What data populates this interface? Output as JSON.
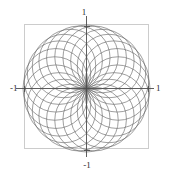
{
  "figure": {
    "title": "",
    "frame": {
      "x0": 24,
      "y0": 24,
      "x1": 149,
      "y1": 149,
      "color": "#cccccc",
      "visible": true
    },
    "axes": {
      "origin_x": 86.5,
      "origin_y": 88.5,
      "color": "#4d4d4d",
      "x_label_min": "-1",
      "x_label_max": "1",
      "y_label_min": "-1",
      "y_label_max": "1",
      "tick_length": 3
    },
    "curve_color": "#6b6b6b",
    "background": "#ffffff"
  },
  "labels": {
    "top": "1",
    "bottom": "-1",
    "left": "-1",
    "right": "1"
  },
  "chart_data": {
    "type": "line",
    "title": "",
    "xlabel": "",
    "ylabel": "",
    "xlim": [
      -1,
      1
    ],
    "ylim": [
      -1,
      1
    ],
    "xticks": [
      -1,
      1
    ],
    "yticks": [
      -1,
      1
    ],
    "xticklabels": [
      "-1",
      "1"
    ],
    "yticklabels": [
      "-1",
      "1"
    ],
    "grid": false,
    "legend": null,
    "series": [
      {
        "name": "circle-rosette",
        "parametric": true,
        "circle_count": 24,
        "circle_radius": 0.5,
        "center_radius": 0.5,
        "angle_step_deg": 15,
        "center_angles_deg": [
          0,
          15,
          30,
          45,
          60,
          75,
          90,
          105,
          120,
          135,
          150,
          165,
          180,
          195,
          210,
          225,
          240,
          255,
          270,
          285,
          300,
          315,
          330,
          345
        ],
        "centers": [
          [
            0.5,
            0.0
          ],
          [
            0.483,
            0.129
          ],
          [
            0.433,
            0.25
          ],
          [
            0.354,
            0.354
          ],
          [
            0.25,
            0.433
          ],
          [
            0.129,
            0.483
          ],
          [
            0.0,
            0.5
          ],
          [
            -0.129,
            0.483
          ],
          [
            -0.25,
            0.433
          ],
          [
            -0.354,
            0.354
          ],
          [
            -0.433,
            0.25
          ],
          [
            -0.483,
            0.129
          ],
          [
            -0.5,
            0.0
          ],
          [
            -0.483,
            -0.129
          ],
          [
            -0.433,
            -0.25
          ],
          [
            -0.354,
            -0.354
          ],
          [
            -0.25,
            -0.433
          ],
          [
            -0.129,
            -0.483
          ],
          [
            0.0,
            -0.5
          ],
          [
            0.129,
            -0.483
          ],
          [
            0.25,
            -0.433
          ],
          [
            0.354,
            -0.354
          ],
          [
            0.433,
            -0.25
          ],
          [
            0.483,
            -0.129
          ]
        ]
      }
    ]
  }
}
